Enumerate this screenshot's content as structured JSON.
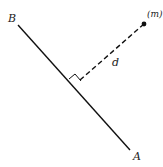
{
  "diagram": {
    "line": {
      "start_label": "B",
      "end_label": "A",
      "color": "#111111"
    },
    "point": {
      "label": "(m)",
      "color": "#111111"
    },
    "distance": {
      "label": "d",
      "style": "dashed",
      "perpendicular_marker": true
    }
  }
}
